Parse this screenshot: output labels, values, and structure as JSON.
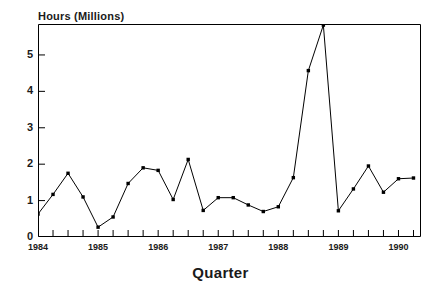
{
  "figure": {
    "ylabel": "Hours (Millions)",
    "xlabel": "Quarter",
    "caption": ""
  },
  "axes": {
    "y_ticks": [
      "0",
      "1",
      "2",
      "3",
      "4",
      "5"
    ],
    "x_ticks": [
      "1984",
      "1985",
      "1986",
      "1987",
      "1988",
      "1989",
      "1990"
    ]
  },
  "chart_data": {
    "type": "line",
    "title": "",
    "xlabel": "Quarter",
    "ylabel": "Hours (Millions)",
    "grid": false,
    "legend": false,
    "marker": "square",
    "line_color": "#000000",
    "xlim": [
      1984.0,
      1990.375
    ],
    "ylim": [
      0,
      5.85
    ],
    "x": [
      1984.0,
      1984.25,
      1984.5,
      1984.75,
      1985.0,
      1985.25,
      1985.5,
      1985.75,
      1986.0,
      1986.25,
      1986.5,
      1986.75,
      1987.0,
      1987.25,
      1987.5,
      1987.75,
      1988.0,
      1988.25,
      1988.5,
      1988.75,
      1989.0,
      1989.25,
      1989.5,
      1989.75,
      1990.0,
      1990.25
    ],
    "x_tick_labels": [
      "1984 Q1",
      "1984 Q2",
      "1984 Q3",
      "1984 Q4",
      "1985 Q1",
      "1985 Q2",
      "1985 Q3",
      "1985 Q4",
      "1986 Q1",
      "1986 Q2",
      "1986 Q3",
      "1986 Q4",
      "1987 Q1",
      "1987 Q2",
      "1987 Q3",
      "1987 Q4",
      "1988 Q1",
      "1988 Q2",
      "1988 Q3",
      "1988 Q4",
      "1989 Q1",
      "1989 Q2",
      "1989 Q3",
      "1989 Q4",
      "1990 Q1",
      "1990 Q2"
    ],
    "values": [
      0.63,
      1.17,
      1.75,
      1.1,
      0.27,
      0.55,
      1.47,
      1.9,
      1.83,
      1.03,
      2.13,
      0.73,
      1.08,
      1.08,
      0.88,
      0.7,
      0.83,
      1.63,
      4.57,
      5.82,
      0.72,
      1.32,
      1.95,
      1.23,
      1.6,
      1.62
    ]
  }
}
